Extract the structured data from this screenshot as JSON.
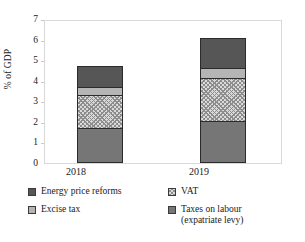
{
  "chart_data": {
    "type": "bar",
    "subtype": "stacked-column",
    "title": "",
    "xlabel": "",
    "ylabel": "% of GDP",
    "ylim": [
      0,
      7
    ],
    "ytick_step": 1,
    "yticks": [
      "7",
      "6",
      "5",
      "4",
      "3",
      "2",
      "1",
      "0"
    ],
    "grid": false,
    "legend_position": "bottom",
    "categories": [
      "2018",
      "2019"
    ],
    "series": [
      {
        "name": "Taxes on labour\n(expatriate levy)",
        "key": "labour",
        "values": [
          1.7,
          2.05
        ],
        "color": "#767676",
        "pattern": "solid"
      },
      {
        "name": "VAT",
        "key": "vat",
        "values": [
          1.6,
          2.1
        ],
        "color": "#d9d9d9",
        "pattern": "crosshatch"
      },
      {
        "name": "Excise tax",
        "key": "excise",
        "values": [
          0.4,
          0.45
        ],
        "color": "#b5b5b5",
        "pattern": "solid"
      },
      {
        "name": "Energy price reforms",
        "key": "energy",
        "values": [
          1.0,
          1.5
        ],
        "color": "#565656",
        "pattern": "solid"
      }
    ],
    "totals": [
      4.7,
      6.1
    ],
    "cumulative": {
      "2018": {
        "labour": [
          0,
          1.7
        ],
        "vat": [
          1.7,
          3.3
        ],
        "excise": [
          3.3,
          3.7
        ],
        "energy": [
          3.7,
          4.7
        ]
      },
      "2019": {
        "labour": [
          0,
          2.05
        ],
        "vat": [
          2.05,
          4.15
        ],
        "excise": [
          4.15,
          4.6
        ],
        "energy": [
          4.6,
          6.1
        ]
      }
    }
  },
  "axis": {
    "y_title": "% of GDP",
    "ticks": [
      "7",
      "6",
      "5",
      "4",
      "3",
      "2",
      "1",
      "0"
    ]
  },
  "xlabels": {
    "first": "2018",
    "second": "2019"
  },
  "legend": {
    "items": [
      {
        "label": "Energy price reforms"
      },
      {
        "label": "VAT"
      },
      {
        "label": "Excise tax"
      },
      {
        "label": "Taxes on labour\n(expatriate levy)"
      }
    ]
  },
  "colors": {
    "energy": "#565656",
    "vat": "#d9d9d9",
    "excise": "#b5b5b5",
    "labour": "#767676",
    "frame": "#d8d8d8",
    "outline": "#2b2b2b"
  }
}
